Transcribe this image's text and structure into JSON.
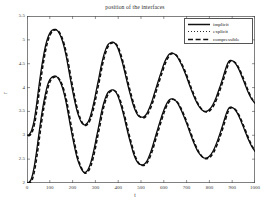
{
  "chart_data": {
    "type": "line",
    "title": "position of the interfaces",
    "xlabel": "t",
    "ylabel": "r",
    "xlim": [
      0,
      1000
    ],
    "ylim": [
      2,
      5.5
    ],
    "grid": false,
    "legend_position": "top-right",
    "xticks": [
      0,
      100,
      200,
      300,
      400,
      500,
      600,
      700,
      800,
      900,
      1000
    ],
    "yticks": [
      2,
      2.5,
      3,
      3.5,
      4,
      4.5,
      5,
      5.5
    ],
    "ytick_labels": [
      "2",
      "2.5",
      "3",
      "3.5",
      "4",
      "4.5",
      "5",
      "5.5"
    ],
    "xtick_labels": [
      "0",
      "100",
      "200",
      "300",
      "400",
      "500",
      "600",
      "700",
      "800",
      "900",
      "1000"
    ],
    "legend": [
      {
        "label": "implicit",
        "style": "solid"
      },
      {
        "label": "explicit",
        "style": "dotted"
      },
      {
        "label": "compressible",
        "style": "dashed"
      }
    ],
    "series": [
      {
        "name": "interface-1-implicit",
        "style": "solid",
        "x": [
          0,
          10,
          20,
          30,
          40,
          50,
          60,
          70,
          80,
          90,
          100,
          110,
          120,
          125,
          130,
          140,
          150,
          160,
          170,
          180,
          190,
          200,
          210,
          220,
          230,
          240,
          250,
          255,
          265,
          275,
          285,
          295,
          305,
          315,
          325,
          335,
          345,
          355,
          365,
          375,
          385,
          395,
          405,
          415,
          425,
          435,
          445,
          455,
          465,
          475,
          485,
          495,
          505,
          510,
          520,
          530,
          545,
          560,
          575,
          590,
          605,
          620,
          630,
          640,
          655,
          670,
          685,
          700,
          715,
          730,
          745,
          755,
          770,
          785,
          800,
          815,
          830,
          845,
          860,
          875,
          885,
          895,
          910,
          925,
          940,
          955,
          970,
          985,
          1000
        ],
        "y": [
          3.0,
          3.02,
          3.1,
          3.28,
          3.58,
          3.95,
          4.3,
          4.6,
          4.85,
          5.03,
          5.14,
          5.2,
          5.22,
          5.22,
          5.21,
          5.15,
          5.05,
          4.9,
          4.7,
          4.45,
          4.18,
          3.93,
          3.7,
          3.5,
          3.36,
          3.26,
          3.22,
          3.22,
          3.26,
          3.36,
          3.52,
          3.73,
          3.97,
          4.2,
          4.45,
          4.65,
          4.8,
          4.9,
          4.94,
          4.95,
          4.93,
          4.86,
          4.74,
          4.58,
          4.4,
          4.2,
          4.0,
          3.82,
          3.65,
          3.52,
          3.43,
          3.39,
          3.38,
          3.38,
          3.42,
          3.5,
          3.67,
          3.9,
          4.13,
          4.35,
          4.55,
          4.68,
          4.72,
          4.72,
          4.67,
          4.55,
          4.4,
          4.22,
          4.02,
          3.84,
          3.68,
          3.6,
          3.52,
          3.5,
          3.54,
          3.64,
          3.8,
          4.0,
          4.22,
          4.45,
          4.55,
          4.57,
          4.53,
          4.42,
          4.26,
          4.08,
          3.9,
          3.76,
          3.67
        ]
      },
      {
        "name": "interface-2-implicit",
        "style": "solid",
        "x": [
          0,
          10,
          20,
          30,
          40,
          50,
          60,
          70,
          80,
          90,
          100,
          110,
          120,
          125,
          130,
          140,
          150,
          160,
          170,
          180,
          190,
          200,
          210,
          220,
          230,
          240,
          250,
          255,
          265,
          275,
          285,
          295,
          305,
          315,
          325,
          335,
          345,
          355,
          365,
          375,
          385,
          395,
          405,
          415,
          425,
          435,
          445,
          455,
          465,
          475,
          485,
          495,
          505,
          510,
          520,
          530,
          545,
          560,
          575,
          590,
          605,
          620,
          630,
          640,
          655,
          670,
          685,
          700,
          715,
          730,
          745,
          755,
          770,
          785,
          800,
          815,
          830,
          845,
          860,
          875,
          885,
          895,
          910,
          925,
          940,
          955,
          970,
          985,
          1000
        ],
        "y": [
          2.0,
          2.02,
          2.1,
          2.3,
          2.6,
          2.95,
          3.3,
          3.6,
          3.85,
          4.05,
          4.17,
          4.22,
          4.24,
          4.24,
          4.23,
          4.17,
          4.07,
          3.92,
          3.72,
          3.47,
          3.2,
          2.95,
          2.72,
          2.52,
          2.38,
          2.28,
          2.22,
          2.22,
          2.26,
          2.36,
          2.52,
          2.73,
          2.97,
          3.2,
          3.45,
          3.65,
          3.8,
          3.9,
          3.94,
          3.95,
          3.93,
          3.86,
          3.74,
          3.58,
          3.4,
          3.2,
          3.0,
          2.82,
          2.65,
          2.52,
          2.43,
          2.39,
          2.38,
          2.38,
          2.42,
          2.5,
          2.68,
          2.92,
          3.16,
          3.39,
          3.59,
          3.72,
          3.76,
          3.76,
          3.71,
          3.59,
          3.43,
          3.25,
          3.05,
          2.86,
          2.7,
          2.62,
          2.54,
          2.52,
          2.56,
          2.66,
          2.82,
          3.02,
          3.24,
          3.47,
          3.57,
          3.59,
          3.55,
          3.44,
          3.28,
          3.1,
          2.92,
          2.77,
          2.66
        ]
      }
    ]
  }
}
